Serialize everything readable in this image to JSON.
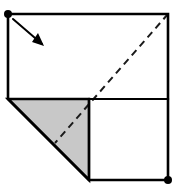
{
  "figure": {
    "canvas": {
      "width": 177,
      "height": 193,
      "background": "#ffffff"
    },
    "colors": {
      "stroke": "#000000",
      "shade_fill": "#c8c8c8",
      "shade_stroke": "#000000",
      "paper_fill": "#ffffff",
      "dash": "#1a1a1a",
      "arrow": "#000000",
      "dot": "#000000"
    },
    "stroke_widths": {
      "outline": 2.6,
      "interior": 2.2,
      "dashed": 2.0,
      "arrow": 2.0
    },
    "vertices": {
      "top_left": {
        "x": 8,
        "y": 14,
        "label": "A"
      },
      "top_right": {
        "x": 168,
        "y": 14,
        "label": "B"
      },
      "mid_right": {
        "x": 168,
        "y": 99,
        "label": "C"
      },
      "center": {
        "x": 89,
        "y": 99,
        "label": "D"
      },
      "left_mid": {
        "x": 8,
        "y": 99,
        "label": "E"
      },
      "bottom_mid": {
        "x": 89,
        "y": 180,
        "label": "F"
      },
      "bottom_right": {
        "x": 168,
        "y": 180,
        "label": "G"
      }
    },
    "outline_path": "M 8 14 L 168 14 L 168 180 L 89 180 L 8 99 Z",
    "interior_lines": [
      {
        "name": "horizontal-divider",
        "x1": 89,
        "y1": 99,
        "x2": 168,
        "y2": 99
      },
      {
        "name": "vertical-divider",
        "x1": 89,
        "y1": 99,
        "x2": 89,
        "y2": 180
      }
    ],
    "shaded_region": {
      "name": "shaded-triangle",
      "points": "8,99 89,99 89,180",
      "fill": "#c8c8c8"
    },
    "dashed_crease": {
      "name": "fold-crease",
      "x1": 168,
      "y1": 14,
      "x2": 55,
      "y2": 143,
      "dash_pattern": "7,5"
    },
    "fold_arrow": {
      "name": "fold-direction-arrow",
      "x1": 13,
      "y1": 19,
      "x2": 42,
      "y2": 44,
      "head_points": "44,46 32,42 38,33"
    },
    "dots": [
      {
        "name": "corner-dot-top-left",
        "cx": 8,
        "cy": 14,
        "r": 4
      },
      {
        "name": "corner-dot-bottom-right",
        "cx": 168,
        "cy": 180,
        "r": 4
      }
    ]
  }
}
